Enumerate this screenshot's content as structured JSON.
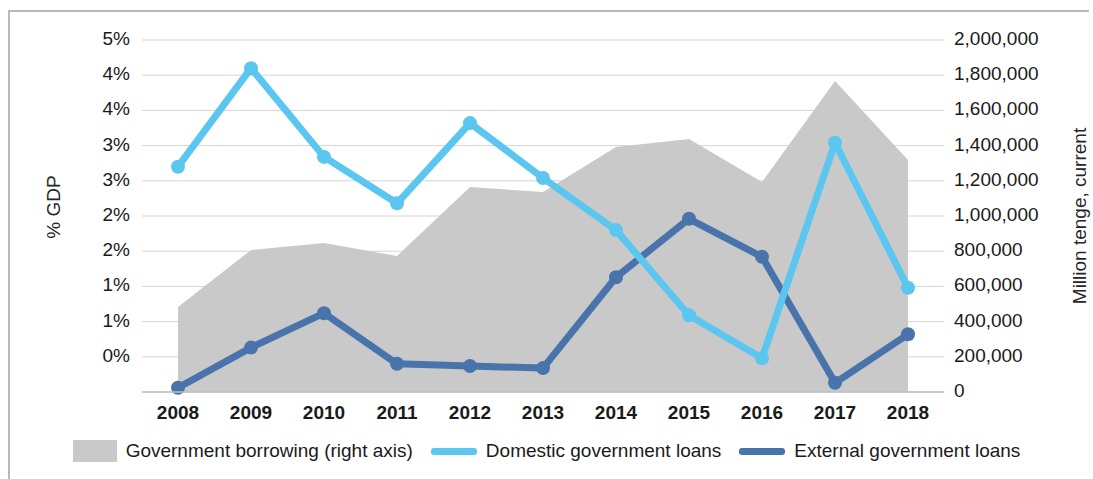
{
  "axes": {
    "y_left_title": "% GDP",
    "y_right_title": "Million tenge, current",
    "y_left_ticks": [
      "5%",
      "4%",
      "4%",
      "3%",
      "3%",
      "2%",
      "2%",
      "1%",
      "1%",
      "0%"
    ],
    "y_right_ticks": [
      "2,000,000",
      "1,800,000",
      "1,600,000",
      "1,400,000",
      "1,200,000",
      "1,000,000",
      "800,000",
      "600,000",
      "400,000",
      "200,000",
      "0"
    ],
    "x_ticks": [
      "2008",
      "2009",
      "2010",
      "2011",
      "2012",
      "2013",
      "2014",
      "2015",
      "2016",
      "2017",
      "2018"
    ]
  },
  "legend": {
    "items": [
      {
        "label": "Government borrowing (right axis)",
        "marker": "area-swatch",
        "color": "#c9c9c9"
      },
      {
        "label": "Domestic government loans",
        "marker": "line-swatch",
        "color": "#5bc6ef"
      },
      {
        "label": "External government loans",
        "marker": "line-swatch",
        "color": "#4874ab"
      }
    ]
  },
  "colors": {
    "area_fill": "#c9c9c9",
    "domestic_line": "#5bc6ef",
    "external_line": "#4874ab",
    "gridline": "#d4d4d4",
    "frame": "#b9b9b9",
    "text": "#1a1a1a"
  },
  "chart_data": {
    "type": "line",
    "title": "",
    "xlabel": "",
    "ylabel": "% GDP",
    "y2label": "Million tenge, current",
    "grid": true,
    "legend_position": "bottom",
    "x": [
      "2008",
      "2009",
      "2010",
      "2011",
      "2012",
      "2013",
      "2014",
      "2015",
      "2016",
      "2017",
      "2018"
    ],
    "ylim": [
      0,
      5
    ],
    "y2lim": [
      0,
      2000000
    ],
    "y_tick_values": [
      5,
      4.5,
      4,
      3.5,
      3,
      2.5,
      2,
      1.5,
      1,
      0.5,
      0
    ],
    "y2_tick_values": [
      2000000,
      1800000,
      1600000,
      1400000,
      1200000,
      1000000,
      800000,
      600000,
      400000,
      200000,
      0
    ],
    "series": [
      {
        "name": "Government borrowing (right axis)",
        "type": "area",
        "axis": "right",
        "color": "#c9c9c9",
        "values": [
          483000,
          807000,
          847000,
          773000,
          1165000,
          1136000,
          1392000,
          1438000,
          1193000,
          1767000,
          1318000
        ]
      },
      {
        "name": "Domestic government loans",
        "type": "line",
        "axis": "left",
        "color": "#5bc6ef",
        "values": [
          3.2,
          4.6,
          3.34,
          2.68,
          3.82,
          3.04,
          2.3,
          1.09,
          0.48,
          3.54,
          1.48
        ]
      },
      {
        "name": "External government loans",
        "type": "line",
        "axis": "left",
        "color": "#4874ab",
        "values": [
          0.06,
          0.63,
          1.12,
          0.4,
          0.37,
          0.34,
          1.63,
          2.46,
          1.92,
          0.13,
          0.82
        ]
      }
    ]
  }
}
